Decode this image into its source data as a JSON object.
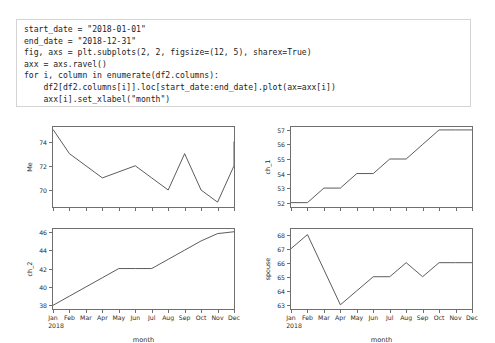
{
  "code_cell": {
    "lines": [
      "start_date = \"2018-01-01\"",
      "end_date = \"2018-12-31\"",
      "fig, axs = plt.subplots(2, 2, figsize=(12, 5), sharex=True)",
      "axx = axs.ravel()",
      "for i, column in enumerate(df2.columns):",
      "    df2[df2.columns[i]].loc[start_date:end_date].plot(ax=axx[i])",
      "    axx[i].set_xlabel(\"month\")",
      "    axx[i].set_ylabel(column)"
    ]
  },
  "figure": {
    "line_color": "#4a4a4a",
    "axis_color": "#6f6f6f",
    "text_color": "#2b2b2b",
    "background": "#ffffff"
  },
  "chart_data": [
    {
      "type": "line",
      "panel": "top-left",
      "title": "",
      "xlabel": "month",
      "ylabel": "Me",
      "categories": [
        "Jan",
        "Feb",
        "Mar",
        "Apr",
        "May",
        "Jun",
        "Jul",
        "Aug",
        "Sep",
        "Oct",
        "Nov",
        "Dec"
      ],
      "x_sub_label": "2018",
      "values": [
        75,
        73,
        72,
        71,
        71.5,
        72,
        71,
        70,
        73,
        70,
        69,
        72
      ],
      "end_value": 74,
      "yticks": [
        70,
        72,
        74
      ],
      "ylim": [
        68.6,
        75.2
      ],
      "grid": false,
      "legend": false
    },
    {
      "type": "line",
      "panel": "top-right",
      "title": "",
      "xlabel": "month",
      "ylabel": "ch_1",
      "categories": [
        "Jan",
        "Feb",
        "Mar",
        "Apr",
        "May",
        "Jun",
        "Jul",
        "Aug",
        "Sep",
        "Oct",
        "Nov",
        "Dec"
      ],
      "x_sub_label": "2018",
      "values": [
        52,
        52,
        53,
        53,
        54,
        54,
        55,
        55,
        56,
        57,
        57,
        57
      ],
      "yticks": [
        52,
        53,
        54,
        55,
        56,
        57
      ],
      "ylim": [
        51.7,
        57.2
      ],
      "grid": false,
      "legend": false
    },
    {
      "type": "line",
      "panel": "bottom-left",
      "title": "",
      "xlabel": "month",
      "ylabel": "ch_2",
      "categories": [
        "Jan",
        "Feb",
        "Mar",
        "Apr",
        "May",
        "Jun",
        "Jul",
        "Aug",
        "Sep",
        "Oct",
        "Nov",
        "Dec"
      ],
      "x_sub_label": "2018",
      "values": [
        38,
        39,
        40,
        41,
        42,
        42,
        42,
        43,
        44,
        45,
        45.8,
        46
      ],
      "yticks": [
        38,
        40,
        42,
        44,
        46
      ],
      "ylim": [
        37.6,
        46.3
      ],
      "grid": false,
      "legend": false
    },
    {
      "type": "line",
      "panel": "bottom-right",
      "title": "",
      "xlabel": "month",
      "ylabel": "spouse",
      "categories": [
        "Jan",
        "Feb",
        "Mar",
        "Apr",
        "May",
        "Jun",
        "Jul",
        "Aug",
        "Sep",
        "Oct",
        "Nov",
        "Dec"
      ],
      "x_sub_label": "2018",
      "values": [
        67,
        68,
        65.5,
        63,
        64,
        65,
        65,
        66,
        65,
        66,
        66,
        66
      ],
      "yticks": [
        63,
        64,
        65,
        66,
        67,
        68
      ],
      "ylim": [
        62.7,
        68.4
      ],
      "grid": false,
      "legend": false
    }
  ]
}
